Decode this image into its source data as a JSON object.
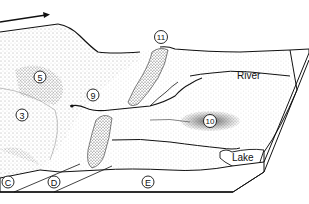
{
  "diagram": {
    "type": "block-diagram",
    "style": "black-and-white stippled illustration",
    "flow_arrow": {
      "direction": "left-to-right",
      "meaning": "ice flow direction"
    },
    "numbered_labels": [
      {
        "id": "3",
        "text": "3"
      },
      {
        "id": "5",
        "text": "5"
      },
      {
        "id": "9",
        "text": "9"
      },
      {
        "id": "10",
        "text": "10"
      },
      {
        "id": "11",
        "text": "11"
      }
    ],
    "zone_labels": [
      {
        "id": "C",
        "text": "C"
      },
      {
        "id": "D",
        "text": "D"
      },
      {
        "id": "E",
        "text": "E"
      }
    ],
    "text_labels": {
      "river": "River",
      "lake": "Lake"
    }
  }
}
